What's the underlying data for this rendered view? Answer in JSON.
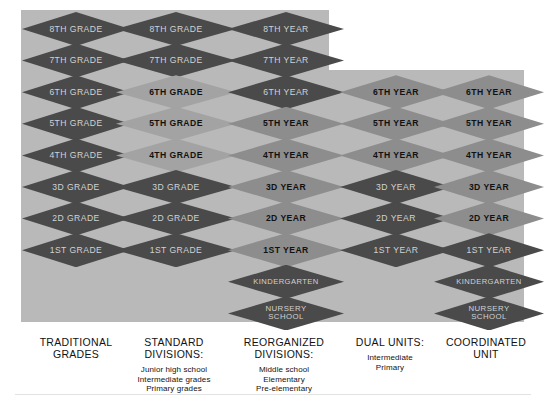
{
  "figure": {
    "background_color": "#ffffff",
    "panel_color": "#b9b9b9",
    "dark_color": "#4a4a4a",
    "mid_color": "#8d8d8d",
    "light_color": "#a3a3a3"
  },
  "columns": [
    {
      "id": "traditional-grades",
      "caption": {
        "head": "TRADITIONAL\nGRADES",
        "sub": ""
      },
      "cells": [
        {
          "label": "8TH GRADE",
          "shade": "dark"
        },
        {
          "label": "7TH GRADE",
          "shade": "dark"
        },
        {
          "label": "6TH GRADE",
          "shade": "dark"
        },
        {
          "label": "5TH GRADE",
          "shade": "dark"
        },
        {
          "label": "4TH GRADE",
          "shade": "dark"
        },
        {
          "label": "3D GRADE",
          "shade": "dark"
        },
        {
          "label": "2D GRADE",
          "shade": "dark"
        },
        {
          "label": "1ST GRADE",
          "shade": "dark"
        }
      ]
    },
    {
      "id": "standard-divisions",
      "caption": {
        "head": "STANDARD\nDIVISIONS:",
        "sub": "Junior high school\nIntermediate grades\nPrimary grades"
      },
      "cells": [
        {
          "label": "8TH GRADE",
          "shade": "dark"
        },
        {
          "label": "7TH GRADE",
          "shade": "dark"
        },
        {
          "label": "6TH GRADE",
          "shade": "light"
        },
        {
          "label": "5TH GRADE",
          "shade": "light"
        },
        {
          "label": "4TH GRADE",
          "shade": "light"
        },
        {
          "label": "3D GRADE",
          "shade": "dark"
        },
        {
          "label": "2D GRADE",
          "shade": "dark"
        },
        {
          "label": "1ST GRADE",
          "shade": "dark"
        }
      ]
    },
    {
      "id": "reorganized-divisions",
      "caption": {
        "head": "REORGANIZED\nDIVISIONS:",
        "sub": "Middle school\nElementary\nPre-elementary"
      },
      "cells": [
        {
          "label": "8TH YEAR",
          "shade": "dark"
        },
        {
          "label": "7TH YEAR",
          "shade": "dark"
        },
        {
          "label": "6TH YEAR",
          "shade": "dark"
        },
        {
          "label": "5TH YEAR",
          "shade": "mid"
        },
        {
          "label": "4TH YEAR",
          "shade": "mid"
        },
        {
          "label": "3D YEAR",
          "shade": "mid"
        },
        {
          "label": "2D YEAR",
          "shade": "mid"
        },
        {
          "label": "1ST YEAR",
          "shade": "mid"
        },
        {
          "label": "KINDERGARTEN",
          "shade": "dark"
        },
        {
          "label": "NURSERY\nSCHOOL",
          "shade": "dark"
        }
      ]
    },
    {
      "id": "dual-units",
      "caption": {
        "head": "DUAL UNITS:",
        "sub": "Intermediate\nPrimary"
      },
      "cells": [
        {
          "label": "6TH YEAR",
          "shade": "mid"
        },
        {
          "label": "5TH YEAR",
          "shade": "mid"
        },
        {
          "label": "4TH YEAR",
          "shade": "mid"
        },
        {
          "label": "3D YEAR",
          "shade": "dark"
        },
        {
          "label": "2D YEAR",
          "shade": "dark"
        },
        {
          "label": "1ST YEAR",
          "shade": "dark"
        }
      ]
    },
    {
      "id": "coordinated-unit",
      "caption": {
        "head": "COORDINATED\nUNIT",
        "sub": ""
      },
      "cells": [
        {
          "label": "6TH YEAR",
          "shade": "mid"
        },
        {
          "label": "5TH YEAR",
          "shade": "mid"
        },
        {
          "label": "4TH YEAR",
          "shade": "mid"
        },
        {
          "label": "3D YEAR",
          "shade": "mid"
        },
        {
          "label": "2D YEAR",
          "shade": "mid"
        },
        {
          "label": "1ST YEAR",
          "shade": "dark"
        },
        {
          "label": "KINDERGARTEN",
          "shade": "dark"
        },
        {
          "label": "NURSERY\nSCHOOL",
          "shade": "dark"
        }
      ]
    }
  ],
  "layout": {
    "col_x": [
      22,
      116,
      228,
      340,
      434
    ],
    "col_w": [
      108,
      120,
      116,
      112,
      110
    ],
    "col_start_row": [
      0,
      0,
      0,
      2,
      2
    ],
    "row_h": 34,
    "row_pitch": 31.6,
    "first_row_top": 12,
    "caption_x": [
      16,
      112,
      224,
      334,
      428
    ],
    "caption_w": [
      120,
      124,
      120,
      112,
      116
    ],
    "caption_top": 336
  }
}
